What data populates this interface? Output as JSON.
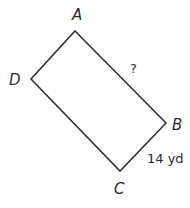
{
  "figure": {
    "shape": "rectangle",
    "vertices": [
      {
        "name": "A",
        "x": 75,
        "y": 31
      },
      {
        "name": "B",
        "x": 166,
        "y": 123
      },
      {
        "name": "C",
        "x": 120,
        "y": 171
      },
      {
        "name": "D",
        "x": 31,
        "y": 79
      }
    ],
    "stroke_color": "#333333",
    "labels": {
      "A": "A",
      "B": "B",
      "C": "C",
      "D": "D"
    },
    "side_AB": {
      "label": "?"
    },
    "side_BC": {
      "label": "14 yd"
    }
  }
}
